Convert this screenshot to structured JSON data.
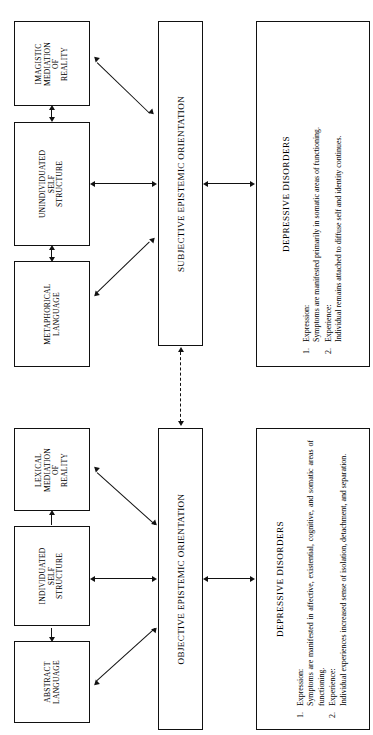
{
  "diagram": {
    "orientation": "rotated-90-ccw",
    "colors": {
      "line": "#111111",
      "background": "#ffffff",
      "text": "#000000"
    },
    "upper_system": {
      "orientation_bar": "SUBJECTIVE EPISTEMIC ORIENTATION",
      "mediation_box": "IMAGISTIC\nMEDIATION\nOF\nREALITY",
      "self_structure_box": "UNINDIVIDUATED\nSELF\nSTRUCTURE",
      "language_box": "METAPHORICAL\nLANGUAGE",
      "panel": {
        "title": "DEPRESSIVE DISORDERS",
        "items": [
          {
            "num": "1.",
            "head": "Expression:",
            "text": "Symptoms are manifested primarily in somatic areas of functioning."
          },
          {
            "num": "2.",
            "head": "Experience:",
            "text": "Individual remains attached to diffuse self and identity continues."
          }
        ]
      }
    },
    "lower_system": {
      "orientation_bar": "OBJECTIVE EPISTEMIC ORIENTATION",
      "mediation_box": "LEXICAL\nMEDIATION\nOF\nREALITY",
      "self_structure_box": "INDIVIDUATED\nSELF\nSTRUCTURE",
      "language_box": "ABSTRACT\nLANGUAGE",
      "panel": {
        "title": "DEPRESSIVE DISORDERS",
        "items": [
          {
            "num": "1.",
            "head": "Expression:",
            "text": "Symptoms are manifested in affective, existential, cognitive, and somatic areas of functioning."
          },
          {
            "num": "2.",
            "head": "Experience:",
            "text": "Individual experiences increased sense of isolation, detachment, and separation."
          }
        ]
      }
    }
  }
}
